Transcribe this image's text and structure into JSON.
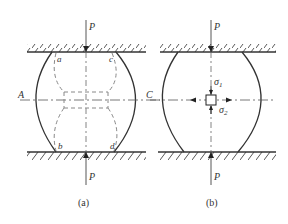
{
  "figure": {
    "panels": [
      {
        "id": "a",
        "caption": "(a)",
        "load_top": "P",
        "load_bottom": "P",
        "point_labels": {
          "a": "a",
          "b": "b",
          "c": "c",
          "d": "d"
        },
        "side_labels": {
          "left": "A",
          "right": "C"
        }
      },
      {
        "id": "b",
        "caption": "(b)",
        "load_top": "P",
        "load_bottom": "P",
        "stress_labels": {
          "sigma1": "σ",
          "sigma1_sub": "1",
          "sigma2": "σ",
          "sigma2_sub": "2"
        }
      }
    ],
    "colors": {
      "stroke": "#333333",
      "dashed": "#777777"
    }
  }
}
